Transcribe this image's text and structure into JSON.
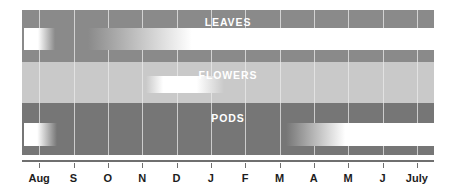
{
  "chart_data": {
    "type": "bar",
    "title": "",
    "subtitle": "",
    "xlabel": "",
    "ylabel": "",
    "grid": true,
    "legend_position": "none",
    "categories": [
      "Aug",
      "S",
      "O",
      "N",
      "D",
      "J",
      "F",
      "M",
      "A",
      "M",
      "J",
      "July"
    ],
    "tick_labels": [
      "Aug",
      "S",
      "O",
      "N",
      "D",
      "J",
      "F",
      "M",
      "A",
      "M",
      "J",
      "July"
    ],
    "xlim": [
      0,
      12
    ],
    "band_colors": {
      "leaves": "#8a8a8a",
      "flowers": "#c9c9c9",
      "pods": "#767676",
      "bar": "#ffffff",
      "gridline": "#e9e9e9",
      "axis": "#6f6f6f",
      "label_text": "#ffffff",
      "tick_text": "#1d1d1d"
    },
    "series": [
      {
        "name": "LEAVES",
        "band_color": "#8a8a8a",
        "segments": [
          {
            "label": "old leaves",
            "start_month": "Aug",
            "end_month": "S",
            "start_pct": 0.5,
            "end_pct": 8.0,
            "fade_in_pct": 0,
            "fade_out_pct": 55
          },
          {
            "label": "new leaves",
            "start_month": "O",
            "end_month": "July",
            "start_pct": 16.0,
            "end_pct": 100.0,
            "fade_in_pct": 30,
            "fade_out_pct": 0
          }
        ]
      },
      {
        "name": "FLOWERS",
        "band_color": "#c9c9c9",
        "segments": [
          {
            "label": "flowering",
            "start_month": "N",
            "end_month": "J",
            "start_pct": 30.0,
            "end_pct": 49.0,
            "fade_in_pct": 22,
            "fade_out_pct": 35
          }
        ]
      },
      {
        "name": "PODS",
        "band_color": "#767676",
        "segments": [
          {
            "label": "old pods",
            "start_month": "Aug",
            "end_month": "S",
            "start_pct": 0.5,
            "end_pct": 8.5,
            "fade_in_pct": 0,
            "fade_out_pct": 60
          },
          {
            "label": "new pods",
            "start_month": "M",
            "end_month": "July",
            "start_pct": 64.0,
            "end_pct": 100.0,
            "fade_in_pct": 40,
            "fade_out_pct": 0
          }
        ]
      }
    ]
  }
}
